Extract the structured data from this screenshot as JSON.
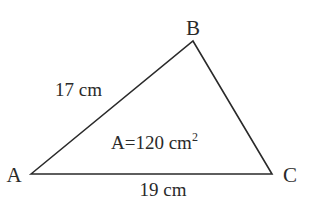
{
  "diagram": {
    "type": "triangle",
    "vertices": {
      "A": {
        "label": "A",
        "x": 31,
        "y": 174
      },
      "B": {
        "label": "B",
        "x": 193,
        "y": 41
      },
      "C": {
        "label": "C",
        "x": 272,
        "y": 174
      }
    },
    "sides": {
      "AB": {
        "label": "17 cm"
      },
      "AC": {
        "label": "19 cm"
      }
    },
    "area": {
      "prefix": "A=120 cm",
      "superscript": "2"
    },
    "colors": {
      "stroke": "#2a2a2a",
      "background": "#ffffff"
    }
  }
}
